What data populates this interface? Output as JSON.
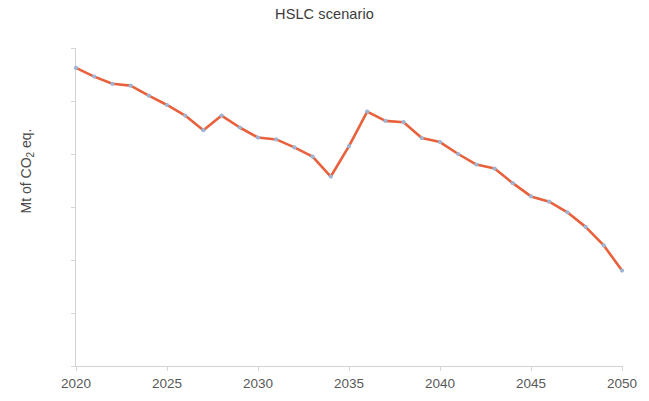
{
  "chart": {
    "title": "HSLC scenario",
    "y_axis_label_main": "Mt of CO",
    "y_axis_label_sub": "2",
    "y_axis_label_tail": " eq."
  },
  "chart_data": {
    "type": "line",
    "title": "HSLC scenario",
    "xlabel": "",
    "ylabel": "Mt of CO2 eq.",
    "xlim": [
      2020,
      2050
    ],
    "ylim": [
      0,
      1200
    ],
    "xticks": [
      2020,
      2025,
      2030,
      2035,
      2040,
      2045,
      2050
    ],
    "yticks": [
      0,
      200,
      400,
      600,
      800,
      1000,
      1200
    ],
    "grid": false,
    "legend": "none",
    "line_color": "#E8613C",
    "marker_color": "#9DB4D4",
    "x": [
      2020,
      2021,
      2022,
      2023,
      2024,
      2025,
      2026,
      2027,
      2028,
      2029,
      2030,
      2031,
      2032,
      2033,
      2034,
      2035,
      2036,
      2037,
      2038,
      2039,
      2040,
      2041,
      2042,
      2043,
      2044,
      2045,
      2046,
      2047,
      2048,
      2049,
      2050
    ],
    "values": [
      1125,
      1092,
      1065,
      1058,
      1020,
      985,
      945,
      890,
      945,
      900,
      862,
      855,
      825,
      790,
      715,
      830,
      960,
      925,
      920,
      860,
      845,
      800,
      760,
      745,
      690,
      640,
      620,
      580,
      525,
      455,
      360
    ],
    "series": [
      {
        "name": "HSLC scenario",
        "values": [
          1125,
          1092,
          1065,
          1058,
          1020,
          985,
          945,
          890,
          945,
          900,
          862,
          855,
          825,
          790,
          715,
          830,
          960,
          925,
          920,
          860,
          845,
          800,
          760,
          745,
          690,
          640,
          620,
          580,
          525,
          455,
          360
        ]
      }
    ]
  }
}
